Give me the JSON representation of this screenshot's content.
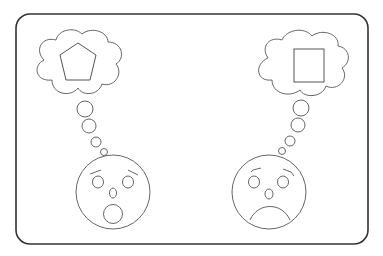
{
  "figure": {
    "stroke_color": "#555555",
    "frame_color": "#333333",
    "background": "#ffffff",
    "characters": [
      {
        "id": "left",
        "expression": "surprised",
        "thought_shape": "pentagon"
      },
      {
        "id": "right",
        "expression": "sad",
        "thought_shape": "square"
      }
    ]
  }
}
